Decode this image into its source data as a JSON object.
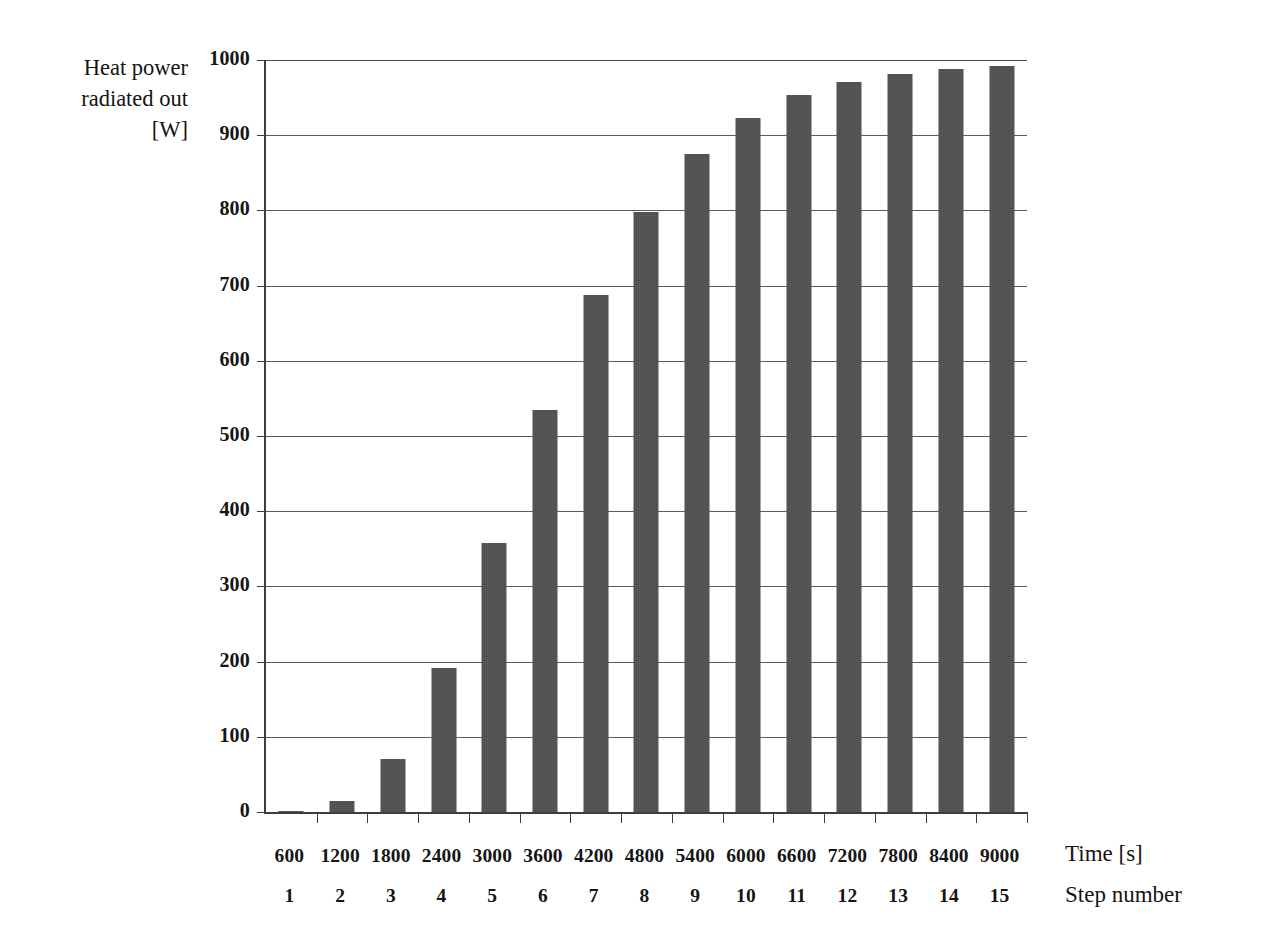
{
  "chart_data": {
    "type": "bar",
    "title": "",
    "ylabel": "Heat power radiated out [W]",
    "ylabel_lines": [
      "Heat power",
      "radiated out",
      "[W]"
    ],
    "xlabel": "Time [s]",
    "xlabel_secondary": "Step number",
    "categories": [
      "600",
      "1200",
      "1800",
      "2400",
      "3000",
      "3600",
      "4200",
      "4800",
      "5400",
      "6000",
      "6600",
      "7200",
      "7800",
      "8400",
      "9000"
    ],
    "step_numbers": [
      "1",
      "2",
      "3",
      "4",
      "5",
      "6",
      "7",
      "8",
      "9",
      "10",
      "11",
      "12",
      "13",
      "14",
      "15"
    ],
    "values": [
      2,
      15,
      70,
      192,
      358,
      535,
      688,
      798,
      875,
      923,
      953,
      971,
      981,
      988,
      992
    ],
    "ylim": [
      0,
      1000
    ],
    "yticks": [
      0,
      100,
      200,
      300,
      400,
      500,
      600,
      700,
      800,
      900,
      1000
    ],
    "ytick_labels": [
      "0",
      "100",
      "200",
      "300",
      "400",
      "500",
      "600",
      "700",
      "800",
      "900",
      "1000"
    ],
    "grid": true,
    "legend": false,
    "bar_color": "#4a4a4a",
    "axis_color": "#3d3d3d",
    "gridline_color": "#5a5a5a",
    "background_color": "#ffffff"
  }
}
